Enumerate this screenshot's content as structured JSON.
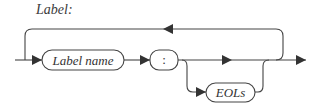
{
  "diagram": {
    "type": "railroad-syntax-diagram",
    "title": "Label:",
    "colors": {
      "line": "#444444",
      "text": "#333333",
      "background": "#ffffff"
    },
    "nodes": [
      {
        "id": "label-name",
        "label": "Label name",
        "kind": "nonterminal"
      },
      {
        "id": "colon",
        "label": ":",
        "kind": "terminal"
      },
      {
        "id": "eols",
        "label": "EOLs",
        "kind": "nonterminal",
        "optional": true
      }
    ],
    "edges": [
      {
        "from": "start",
        "to": "label-name"
      },
      {
        "from": "label-name",
        "to": "colon"
      },
      {
        "from": "colon",
        "to": "end",
        "note": "direct path"
      },
      {
        "from": "colon",
        "to": "eols",
        "note": "optional branch"
      },
      {
        "from": "eols",
        "to": "end"
      },
      {
        "from": "end",
        "to": "start",
        "note": "repeat loop (top)"
      }
    ]
  }
}
